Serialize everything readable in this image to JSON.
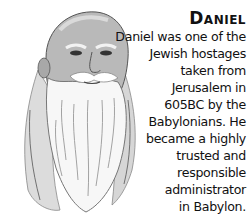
{
  "illustration": {
    "subject": "portrait of Daniel, bald elderly man with long white beard",
    "icon": "portrait-illustration"
  },
  "caption": {
    "title": "Daniel",
    "lines": [
      "Daniel was one of the",
      "Jewish hostages",
      "taken from",
      "Jerusalem in",
      "605BC by the",
      "Babylonians. He",
      "became a highly",
      "trusted and",
      "responsible",
      "administrator",
      "in Babylon."
    ]
  }
}
